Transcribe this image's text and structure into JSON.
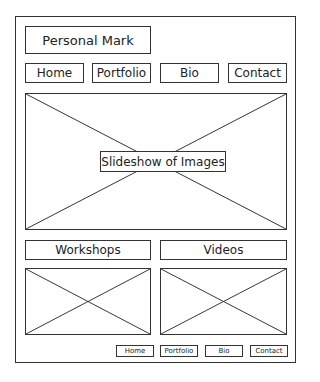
{
  "header": {
    "personal_mark": "Personal Mark"
  },
  "nav": {
    "items": [
      {
        "label": "Home"
      },
      {
        "label": "Portfolio"
      },
      {
        "label": "Bio"
      },
      {
        "label": "Contact"
      }
    ]
  },
  "hero": {
    "label": "Slideshow of Images"
  },
  "sections": [
    {
      "label": "Workshops"
    },
    {
      "label": "Videos"
    }
  ],
  "footer": {
    "items": [
      {
        "label": "Home"
      },
      {
        "label": "Portfolio"
      },
      {
        "label": "Bio"
      },
      {
        "label": "Contact"
      }
    ]
  },
  "colors": {
    "stroke": "#333333",
    "background": "#ffffff"
  }
}
